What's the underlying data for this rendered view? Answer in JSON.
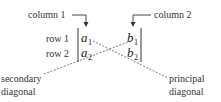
{
  "labels": {
    "column1": "column 1",
    "column2": "column 2",
    "row1": "row 1",
    "row2": "row 2",
    "secondary_line1": "secondary",
    "secondary_line2": "diagonal",
    "principal_line1": "principal",
    "principal_line2": "diagonal"
  },
  "entries": {
    "a1": {
      "base": "a",
      "sub": "1"
    },
    "a2": {
      "base": "a",
      "sub": "2"
    },
    "b1": {
      "base": "b",
      "sub": "1"
    },
    "b2": {
      "base": "b",
      "sub": "2"
    }
  }
}
